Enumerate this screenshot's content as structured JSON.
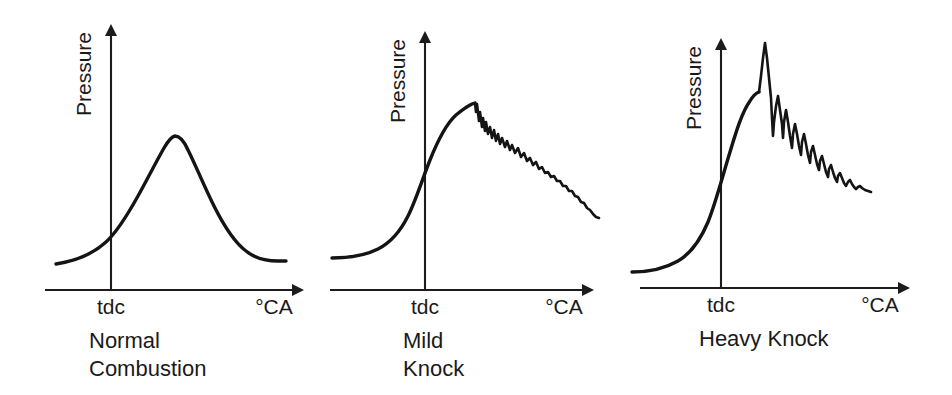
{
  "figure": {
    "background_color": "#ffffff",
    "line_color": "#141414",
    "axis_color": "#1c1c1c"
  },
  "panels": [
    {
      "id": "normal-combustion",
      "caption_line1": "Normal",
      "caption_line2": "Combustion",
      "y_axis_label": "Pressure",
      "x_axis_label": "°CA",
      "tdc_label": "tdc",
      "axis": {
        "x_start": 45,
        "x_end": 292,
        "baseline_y": 290,
        "v_axis_x": 111,
        "v_axis_top": 36,
        "v_axis_bottom": 290
      },
      "trace_path": "M 56 264 C 75 261, 92 255, 106 242 C 118 231, 128 214, 138 196 C 148 178, 156 162, 164 148 C 168 141, 171 137, 175 136 C 180 136, 184 141, 188 150 C 196 166, 204 186, 214 206 C 224 226, 234 242, 246 251 C 256 259, 266 261, 278 261 L 286 261",
      "knock_path": null
    },
    {
      "id": "mild-knock",
      "caption_line1": "Mild",
      "caption_line2": "Knock",
      "y_axis_label": "Pressure",
      "x_axis_label": "°CA",
      "tdc_label": "tdc",
      "axis": {
        "x_start": 20,
        "x_end": 272,
        "baseline_y": 290,
        "v_axis_x": 115,
        "v_axis_top": 43,
        "v_axis_bottom": 290
      },
      "trace_path": "M 22 258 C 38 258, 54 256, 68 249 C 80 243, 90 232, 98 216 C 106 200, 112 180, 120 160 C 128 140, 136 124, 146 115 C 152 110, 158 106, 162 104 L 165 103",
      "knock_path": "M 165 103 L 166 112 L 167 104 L 169 121 L 170 112 L 172 127 L 173 118 L 175 131 L 176 122 L 178 134 L 180 127 L 182 138 L 184 130 L 186 141 L 188 134 L 190 144 L 192 138 L 195 147 L 197 141 L 200 150 L 202 145 L 205 153 L 208 148 L 211 157 L 214 153 L 217 161 L 220 158 L 223 165 L 226 162 L 229 169 L 232 167 L 235 173 L 238 172 L 241 177 L 244 176 L 247 181 L 250 181 L 253 186 L 256 186 L 259 191 L 262 191 L 265 196 L 268 197 L 271 202 L 274 203 L 277 208 L 280 210 L 283 214 L 286 217 L 289 218"
    },
    {
      "id": "heavy-knock",
      "caption_line1": "Heavy Knock",
      "caption_line2": "",
      "y_axis_label": "Pressure",
      "x_axis_label": "°CA",
      "tdc_label": "tdc",
      "axis": {
        "x_start": 20,
        "x_end": 278,
        "baseline_y": 288,
        "v_axis_x": 101,
        "v_axis_top": 50,
        "v_axis_bottom": 288
      },
      "trace_path": "M 12 272 C 28 272, 44 269, 58 261 C 70 254, 80 241, 88 222 C 96 202, 102 178, 110 152 C 116 132, 122 112, 130 101 C 133 96, 136 93, 139 92",
      "knock_path": "M 139 92 L 141 76 L 143 58 L 145 43 L 147 58 L 149 78 L 151 98 L 152 118 L 153 136 L 154 122 L 156 106 L 158 96 L 160 110 L 162 124 L 163 138 L 164 122 L 166 110 L 168 122 L 170 136 L 172 148 L 173 134 L 175 124 L 177 134 L 179 146 L 181 155 L 182 142 L 184 134 L 186 144 L 188 155 L 190 163 L 191 152 L 193 146 L 195 155 L 197 164 L 199 170 L 200 161 L 202 156 L 204 164 L 206 172 L 208 177 L 209 169 L 211 165 L 213 172 L 215 178 L 217 182 L 218 176 L 220 173 L 222 178 L 224 183 L 226 186 L 228 182 L 230 180 L 232 184 L 234 187 L 236 189 L 238 187 L 240 186 L 242 188 L 245 190 L 248 191 L 251 192"
    }
  ]
}
